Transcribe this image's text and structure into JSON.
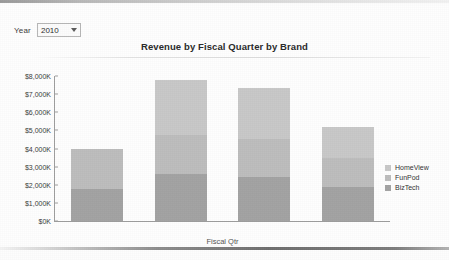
{
  "toolbar": {
    "year_label": "Year",
    "year_value": "2010",
    "caret_icon": "chevron-down-icon"
  },
  "chart_data": {
    "type": "bar",
    "title": "Revenue by Fiscal Quarter by Brand",
    "xlabel": "Fiscal Qtr",
    "ylabel": "",
    "stacked": true,
    "grid": false,
    "legend_position": "right",
    "categories": [
      "2010 Q1",
      "2010 Q2",
      "2010 Q3",
      "2010 Q4"
    ],
    "yticks": [
      "$0K",
      "$1,000K",
      "$2,000K",
      "$3,000K",
      "$4,000K",
      "$5,000K",
      "$6,000K",
      "$7,000K",
      "$8,000K"
    ],
    "ytick_values": [
      0,
      1000,
      2000,
      3000,
      4000,
      5000,
      6000,
      7000,
      8000
    ],
    "ylim": [
      0,
      8000
    ],
    "series": [
      {
        "name": "BizTech",
        "color": "#a3a3a3",
        "values": [
          1750,
          2600,
          2450,
          1850
        ]
      },
      {
        "name": "FunPod",
        "color": "#bdbdbd",
        "values": [
          2200,
          2150,
          2100,
          1650
        ]
      },
      {
        "name": "HomeView",
        "color": "#c8c8c8",
        "values": [
          0,
          3050,
          2800,
          1700
        ]
      }
    ],
    "totals": [
      3950,
      7800,
      7350,
      5200
    ]
  }
}
